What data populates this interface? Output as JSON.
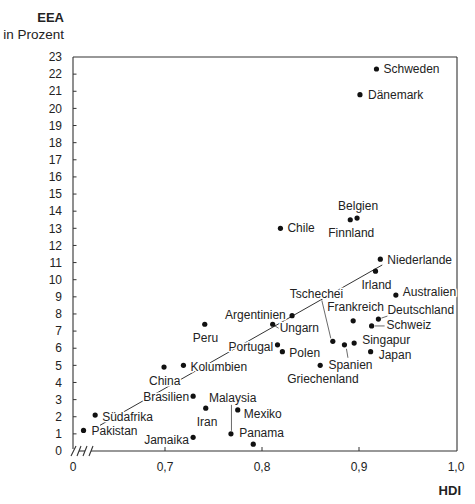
{
  "chart_data": {
    "type": "scatter",
    "title": "",
    "xlabel": "HDI",
    "ylabel": "EEA",
    "ylabel_unit": "in Prozent",
    "xlim": [
      0.6,
      1.0
    ],
    "x_axis_break": true,
    "ylim": [
      0,
      23
    ],
    "grid": false,
    "legend": null,
    "x_ticks": [
      {
        "value": 0,
        "label": "0"
      },
      {
        "value": 0.7,
        "label": "0,7"
      },
      {
        "value": 0.8,
        "label": "0,8"
      },
      {
        "value": 0.9,
        "label": "0,9"
      },
      {
        "value": 1.0,
        "label": "1,0"
      }
    ],
    "y_ticks": [
      0,
      1,
      2,
      3,
      4,
      5,
      6,
      7,
      8,
      9,
      10,
      11,
      12,
      13,
      14,
      15,
      16,
      17,
      18,
      19,
      20,
      21,
      22,
      23
    ],
    "trend_line": {
      "from": [
        0.633,
        1.5
      ],
      "to": [
        0.924,
        10.86
      ]
    },
    "points": [
      {
        "name": "Schweden",
        "hdi": 0.918,
        "eea": 22.3,
        "label_offset": [
          7,
          4
        ]
      },
      {
        "name": "Dänemark",
        "hdi": 0.901,
        "eea": 20.8,
        "label_offset": [
          8,
          4
        ]
      },
      {
        "name": "Belgien",
        "hdi": 0.898,
        "eea": 13.6,
        "label_offset": [
          -19,
          -8
        ]
      },
      {
        "name": "Finnland",
        "hdi": 0.891,
        "eea": 13.5,
        "label_offset": [
          -22,
          17
        ]
      },
      {
        "name": "Chile",
        "hdi": 0.819,
        "eea": 13.0,
        "label_offset": [
          7,
          4
        ]
      },
      {
        "name": "Niederlande",
        "hdi": 0.922,
        "eea": 11.2,
        "label_offset": [
          7,
          5
        ]
      },
      {
        "name": "Irland",
        "hdi": 0.917,
        "eea": 10.5,
        "label_offset": [
          -14,
          18
        ]
      },
      {
        "name": "Australien",
        "hdi": 0.938,
        "eea": 9.1,
        "label_offset": [
          7,
          1
        ]
      },
      {
        "name": "Argentinien",
        "hdi": 0.831,
        "eea": 7.9,
        "label_offset": [
          -67,
          3
        ]
      },
      {
        "name": "Ungarn",
        "hdi": 0.811,
        "eea": 7.4,
        "label_offset": [
          7,
          8
        ],
        "leader": [
          [
            2,
            1.5
          ],
          [
            6,
            4
          ]
        ]
      },
      {
        "name": "Peru",
        "hdi": 0.741,
        "eea": 7.4,
        "label_offset": [
          -12,
          18
        ]
      },
      {
        "name": "Frankreich",
        "hdi": 0.894,
        "eea": 7.6,
        "label_offset": [
          -26,
          -10
        ]
      },
      {
        "name": "Deutschland",
        "hdi": 0.92,
        "eea": 7.7,
        "label_offset": [
          9,
          -5
        ],
        "leader": [
          [
            3,
            -1
          ],
          [
            9,
            -3
          ]
        ]
      },
      {
        "name": "Schweiz",
        "hdi": 0.913,
        "eea": 7.3,
        "label_offset": [
          15,
          3
        ],
        "leader": [
          [
            3,
            0
          ],
          [
            13,
            0
          ]
        ]
      },
      {
        "name": "Tschechei",
        "hdi": 0.873,
        "eea": 6.4,
        "label_offset": [
          -43,
          -43
        ],
        "leader": [
          [
            -2,
            -3
          ],
          [
            -11,
            -41
          ]
        ]
      },
      {
        "name": "Spanien",
        "hdi": 0.885,
        "eea": 6.2,
        "label_offset": [
          -16,
          24
        ],
        "leader": [
          [
            2,
            4
          ],
          [
            3.5,
            13
          ]
        ]
      },
      {
        "name": "Singapur",
        "hdi": 0.895,
        "eea": 6.3,
        "label_offset": [
          8,
          1
        ]
      },
      {
        "name": "Portugal",
        "hdi": 0.816,
        "eea": 6.2,
        "label_offset": [
          -49,
          6
        ]
      },
      {
        "name": "Polen",
        "hdi": 0.821,
        "eea": 5.8,
        "label_offset": [
          7,
          5
        ]
      },
      {
        "name": "Japan",
        "hdi": 0.912,
        "eea": 5.8,
        "label_offset": [
          8,
          7
        ]
      },
      {
        "name": "Griechenland",
        "hdi": 0.86,
        "eea": 5.0,
        "label_offset": [
          -33,
          18
        ]
      },
      {
        "name": "China",
        "hdi": 0.699,
        "eea": 4.9,
        "label_offset": [
          -15,
          18
        ]
      },
      {
        "name": "Kolumbien",
        "hdi": 0.719,
        "eea": 5.0,
        "label_offset": [
          7,
          6
        ]
      },
      {
        "name": "Brasilien",
        "hdi": 0.729,
        "eea": 3.2,
        "label_offset": [
          -50,
          5
        ]
      },
      {
        "name": "Iran",
        "hdi": 0.742,
        "eea": 2.5,
        "label_offset": [
          -9,
          18
        ]
      },
      {
        "name": "Mexiko",
        "hdi": 0.775,
        "eea": 2.4,
        "label_offset": [
          6,
          8
        ]
      },
      {
        "name": "Malaysia",
        "hdi": 0.768,
        "eea": 1.0,
        "label_offset": [
          -22,
          -32
        ],
        "leader": [
          [
            0.5,
            -3
          ],
          [
            0.5,
            -29
          ]
        ]
      },
      {
        "name": "Panama",
        "hdi": 0.791,
        "eea": 0.4,
        "label_offset": [
          -14,
          -7
        ]
      },
      {
        "name": "Jamaika",
        "hdi": 0.729,
        "eea": 0.8,
        "label_offset": [
          -49,
          7
        ]
      },
      {
        "name": "Südafrika",
        "hdi": 0.628,
        "eea": 2.1,
        "label_offset": [
          7,
          6
        ]
      },
      {
        "name": "Pakistan",
        "hdi": 0.616,
        "eea": 1.2,
        "label_offset": [
          8,
          5
        ]
      }
    ]
  },
  "colors": {
    "text": "#222222",
    "axis": "#333333",
    "dot": "#111111",
    "background": "#ffffff"
  }
}
